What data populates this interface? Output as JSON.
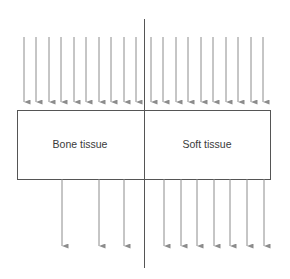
{
  "diagram": {
    "title": "",
    "regions": [
      {
        "id": "bone",
        "label": "Bone tissue",
        "center_x": 80
      },
      {
        "id": "soft",
        "label": "Soft tissue",
        "center_x": 207
      }
    ],
    "box": {
      "x": 17,
      "y": 110,
      "width": 253,
      "height": 69
    },
    "divider": {
      "x": 144,
      "y1": 19,
      "y2": 268
    },
    "incident_arrows": {
      "y_start": 37,
      "y_end": 108,
      "x": [
        24,
        36,
        49,
        61,
        74,
        86,
        99,
        111,
        124,
        136,
        151,
        163,
        176,
        188,
        201,
        213,
        226,
        238,
        251,
        263
      ]
    },
    "transmitted_arrows": {
      "bone": {
        "count": 3,
        "x": [
          62,
          99,
          124
        ]
      },
      "soft": {
        "count": 7,
        "x": [
          164,
          181,
          197,
          214,
          230,
          247,
          264
        ]
      },
      "y_start": 179,
      "y_end": 252
    },
    "colors": {
      "arrow": "#8c8c8c",
      "box_stroke": "#555555",
      "divider": "#555555",
      "text": "#3a3a3a"
    }
  }
}
